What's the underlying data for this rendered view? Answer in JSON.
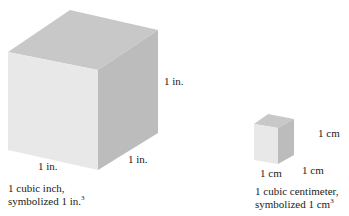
{
  "figure": {
    "large_cube": {
      "height_label": "1 in.",
      "width_label": "1 in.",
      "depth_label": "1 in.",
      "caption_line1": "1 cubic inch,",
      "caption_line2": "symbolized 1 in.",
      "caption_exponent": "3"
    },
    "small_cube": {
      "height_label": "1 cm",
      "width_label": "1 cm",
      "depth_label": "1 cm",
      "caption_line1": "1 cubic centimeter,",
      "caption_line2": "symbolized 1 cm",
      "caption_exponent": "3"
    },
    "colors": {
      "front_face": "#e6e6e6",
      "top_face": "#c9c9c9",
      "side_face": "#bdbdbd"
    }
  }
}
